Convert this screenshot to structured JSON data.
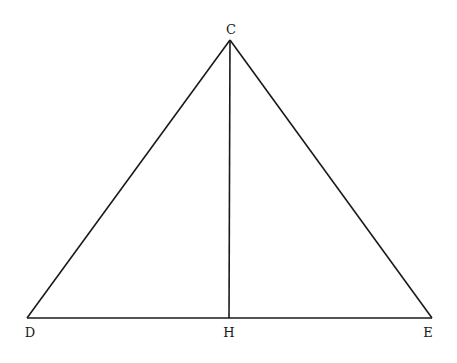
{
  "diagram": {
    "type": "geometry-triangle",
    "points": {
      "C": {
        "label": "C",
        "x": 230,
        "y": 40,
        "lx": 231,
        "ly": 34
      },
      "D": {
        "label": "D",
        "x": 27,
        "y": 318,
        "lx": 30,
        "ly": 337
      },
      "H": {
        "label": "H",
        "x": 229,
        "y": 318,
        "lx": 229,
        "ly": 337
      },
      "E": {
        "label": "E",
        "x": 432,
        "y": 318,
        "lx": 428,
        "ly": 337
      }
    },
    "segments": [
      {
        "name": "segment-cd",
        "from": "C",
        "to": "D"
      },
      {
        "name": "segment-ce",
        "from": "C",
        "to": "E"
      },
      {
        "name": "segment-de",
        "from": "D",
        "to": "E"
      },
      {
        "name": "segment-ch",
        "from": "C",
        "to": "H"
      }
    ],
    "stroke_color": "#1a1a1a",
    "background": "#ffffff"
  }
}
